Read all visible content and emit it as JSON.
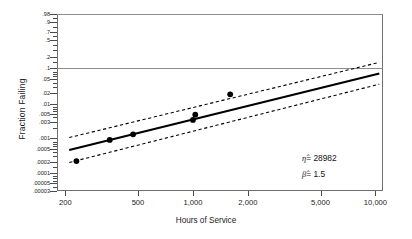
{
  "chart_data": {
    "type": "scatter",
    "title": "",
    "xlabel": "Hours of Service",
    "ylabel": "Fraction Failing",
    "xscale": "log",
    "yscale": "weibull-probability",
    "xlim": [
      180,
      11000
    ],
    "xticks": [
      200,
      500,
      1000,
      2000,
      5000,
      10000
    ],
    "xticklabels": [
      "200",
      "500",
      "1,000",
      "2,000",
      "5,000",
      "10,000"
    ],
    "ylim": [
      3e-05,
      0.98
    ],
    "yticklabels": [
      ".98",
      ".9",
      ".7",
      ".5",
      ".2",
      ".1",
      ".05",
      ".02",
      ".01",
      ".005",
      ".003",
      ".001",
      ".0005",
      ".0002",
      ".0001",
      ".00005",
      ".00003"
    ],
    "ytickvalues": [
      0.98,
      0.9,
      0.7,
      0.5,
      0.2,
      0.1,
      0.05,
      0.02,
      0.01,
      0.005,
      0.003,
      0.001,
      0.0005,
      0.0002,
      0.0001,
      5e-05,
      3e-05
    ],
    "gridlines": [
      0.98,
      0.1
    ],
    "grid": false,
    "legend": "none",
    "points": [
      {
        "x": 230,
        "y": 0.00022
      },
      {
        "x": 350,
        "y": 0.0009
      },
      {
        "x": 470,
        "y": 0.0013
      },
      {
        "x": 1000,
        "y": 0.0034
      },
      {
        "x": 1030,
        "y": 0.0048
      },
      {
        "x": 1600,
        "y": 0.0185
      }
    ],
    "fit_line": {
      "style": "solid",
      "x": [
        210,
        10500
      ],
      "y": [
        0.00046,
        0.072
      ]
    },
    "confidence_bounds": [
      {
        "name": "upper",
        "style": "dashed",
        "x": [
          210,
          10500
        ],
        "y": [
          0.00105,
          0.145
        ]
      },
      {
        "name": "lower",
        "style": "dashed",
        "x": [
          210,
          10500
        ],
        "y": [
          0.0002,
          0.036
        ]
      }
    ],
    "annotations": [
      {
        "id": "eta",
        "symbol": "η̂",
        "equals": "=",
        "value": "28982",
        "text": "η̂ = 28982"
      },
      {
        "id": "beta",
        "symbol": "β̂",
        "equals": "=",
        "value": "1.5",
        "text": "β̂ = 1.5"
      }
    ],
    "colors": {
      "fit_line": "#000000",
      "bounds": "#000000",
      "points": "#000000",
      "frame": "#6f6f6f",
      "gridline": "#8c8c8c",
      "text": "#1a1a1a"
    }
  }
}
